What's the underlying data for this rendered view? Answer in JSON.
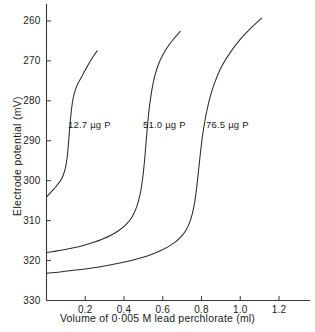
{
  "chart_data": {
    "type": "line",
    "title": "",
    "xlabel": "Volume of 0·005 M lead perchlorate  (ml)",
    "ylabel": "Electrode  potential  (mV)",
    "xlim": [
      0,
      1.36
    ],
    "ylim": [
      330,
      256
    ],
    "y_axis_inverted": true,
    "grid": false,
    "legend": "none (inline curve annotations)",
    "xticks": [
      "0.2",
      "0.4",
      "0.6",
      "0.8",
      "1.0",
      "1.2"
    ],
    "xtick_values": [
      0.2,
      0.4,
      0.6,
      0.8,
      1.0,
      1.2
    ],
    "yticks": [
      "260",
      "270",
      "280",
      "290",
      "300",
      "310",
      "320",
      "330"
    ],
    "ytick_values": [
      260,
      270,
      280,
      290,
      300,
      310,
      320,
      330
    ],
    "line_color": "#2b2b2b",
    "axis_color": "#3a3a3a",
    "series": [
      {
        "name": "12.7 µg P",
        "annotation": "12.7 µg P",
        "x": [
          0.0,
          0.015,
          0.03,
          0.045,
          0.06,
          0.072,
          0.083,
          0.092,
          0.1,
          0.107,
          0.112,
          0.117,
          0.122,
          0.128,
          0.134,
          0.142,
          0.152,
          0.165,
          0.18,
          0.2,
          0.222,
          0.245,
          0.262
        ],
        "y": [
          304.0,
          303.3,
          302.5,
          301.7,
          300.8,
          300.0,
          299.0,
          297.8,
          296.2,
          294.0,
          291.5,
          288.5,
          285.5,
          282.6,
          280.3,
          278.4,
          276.8,
          275.4,
          274.1,
          272.3,
          270.4,
          268.6,
          267.5
        ]
      },
      {
        "name": "51.0 µg P",
        "annotation": "51.0 µg P",
        "x": [
          0.0,
          0.04,
          0.09,
          0.14,
          0.19,
          0.24,
          0.29,
          0.335,
          0.375,
          0.41,
          0.44,
          0.465,
          0.483,
          0.496,
          0.506,
          0.514,
          0.522,
          0.531,
          0.542,
          0.556,
          0.575,
          0.6,
          0.632,
          0.665,
          0.69
        ],
        "y": [
          318.0,
          317.7,
          317.3,
          316.8,
          316.2,
          315.5,
          314.6,
          313.6,
          312.4,
          311.0,
          309.2,
          306.6,
          303.4,
          299.5,
          295.0,
          290.3,
          285.8,
          281.6,
          277.8,
          274.3,
          271.2,
          268.5,
          266.0,
          264.0,
          262.6
        ]
      },
      {
        "name": "76.5 µg P",
        "annotation": "76.5 µg P",
        "x": [
          0.0,
          0.06,
          0.13,
          0.2,
          0.27,
          0.34,
          0.41,
          0.475,
          0.535,
          0.59,
          0.64,
          0.685,
          0.72,
          0.745,
          0.762,
          0.774,
          0.784,
          0.794,
          0.806,
          0.822,
          0.843,
          0.87,
          0.905,
          0.95,
          1.0,
          1.055,
          1.11
        ],
        "y": [
          323.2,
          322.9,
          322.5,
          322.1,
          321.6,
          321.0,
          320.3,
          319.5,
          318.6,
          317.5,
          316.2,
          314.5,
          312.4,
          309.6,
          306.2,
          302.2,
          297.8,
          293.2,
          288.5,
          283.8,
          279.3,
          275.2,
          271.3,
          267.8,
          264.6,
          261.8,
          259.3
        ]
      }
    ]
  },
  "annotations": [
    {
      "label": "12.7 µg P"
    },
    {
      "label": "51.0 µg P"
    },
    {
      "label": "76.5 µg P"
    }
  ]
}
